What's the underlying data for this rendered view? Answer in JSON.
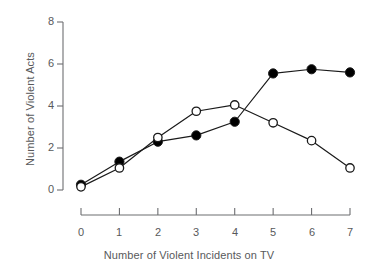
{
  "chart_data": {
    "type": "line",
    "title": "",
    "xlabel": "Number of Violent Incidents on TV",
    "ylabel": "Number of Violent Acts",
    "x": [
      0,
      1,
      2,
      3,
      4,
      5,
      6,
      7
    ],
    "xlim": [
      0,
      7
    ],
    "ylim": [
      0,
      8
    ],
    "xticks": [
      "0",
      "1",
      "2",
      "3",
      "4",
      "5",
      "6",
      "7"
    ],
    "yticks": [
      "0",
      "2",
      "4",
      "6",
      "8"
    ],
    "grid": false,
    "legend": "none",
    "series": [
      {
        "name": "filled-circle-series",
        "marker": "filled-circle",
        "color": "#000000",
        "values": [
          0.25,
          1.35,
          2.3,
          2.6,
          3.25,
          5.55,
          5.75,
          5.6
        ]
      },
      {
        "name": "open-circle-series",
        "marker": "open-circle",
        "color": "#000000",
        "values": [
          0.15,
          1.05,
          2.5,
          3.75,
          4.05,
          3.2,
          2.35,
          1.05
        ]
      }
    ]
  },
  "axes": {
    "x_title": "Number of Violent Incidents on TV",
    "y_title": "Number of Violent Acts",
    "x_tick_labels": [
      "0",
      "1",
      "2",
      "3",
      "4",
      "5",
      "6",
      "7"
    ],
    "y_tick_labels": [
      "0",
      "2",
      "4",
      "6",
      "8"
    ]
  },
  "colors": {
    "axis": "#6d6e71",
    "text": "#58595b",
    "line": "#1a1a1a",
    "marker_fill": "#000000",
    "marker_open_fill": "#ffffff"
  }
}
